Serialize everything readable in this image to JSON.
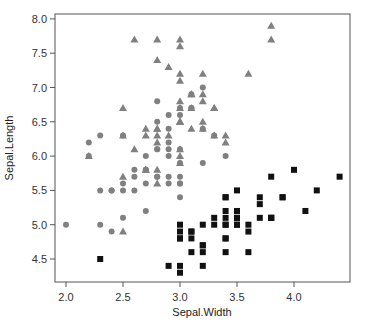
{
  "chart_data": {
    "type": "scatter",
    "title": "",
    "xlabel": "Sepal.Width",
    "ylabel": "Sepal.Length",
    "xlim": [
      1.9,
      4.5
    ],
    "ylim": [
      4.2,
      8.05
    ],
    "x_ticks": [
      "2.0",
      "2.5",
      "3.0",
      "3.5",
      "4.0"
    ],
    "y_ticks": [
      "4.5",
      "5.0",
      "5.5",
      "6.0",
      "6.5",
      "7.0",
      "7.5",
      "8.0"
    ],
    "grid": false,
    "legend": "none",
    "series": [
      {
        "name": "setosa",
        "marker": "square",
        "color": "#111111",
        "points": [
          [
            3.5,
            5.1
          ],
          [
            3.0,
            4.9
          ],
          [
            3.2,
            4.7
          ],
          [
            3.1,
            4.6
          ],
          [
            3.6,
            5.0
          ],
          [
            3.9,
            5.4
          ],
          [
            3.4,
            4.6
          ],
          [
            3.4,
            5.0
          ],
          [
            2.9,
            4.4
          ],
          [
            3.1,
            4.9
          ],
          [
            3.7,
            5.4
          ],
          [
            3.4,
            4.8
          ],
          [
            3.0,
            4.8
          ],
          [
            3.0,
            4.3
          ],
          [
            4.0,
            5.8
          ],
          [
            4.4,
            5.7
          ],
          [
            3.9,
            5.4
          ],
          [
            3.5,
            5.1
          ],
          [
            3.8,
            5.7
          ],
          [
            3.8,
            5.1
          ],
          [
            3.4,
            5.4
          ],
          [
            3.7,
            5.1
          ],
          [
            3.6,
            4.6
          ],
          [
            3.3,
            5.1
          ],
          [
            3.4,
            4.8
          ],
          [
            3.0,
            5.0
          ],
          [
            3.4,
            5.0
          ],
          [
            3.5,
            5.2
          ],
          [
            3.4,
            5.2
          ],
          [
            3.2,
            4.7
          ],
          [
            3.1,
            4.8
          ],
          [
            3.4,
            5.4
          ],
          [
            4.1,
            5.2
          ],
          [
            4.2,
            5.5
          ],
          [
            3.1,
            4.9
          ],
          [
            3.2,
            5.0
          ],
          [
            3.5,
            5.5
          ],
          [
            3.6,
            4.9
          ],
          [
            3.0,
            4.4
          ],
          [
            3.4,
            5.1
          ],
          [
            3.5,
            5.0
          ],
          [
            2.3,
            4.5
          ],
          [
            3.2,
            4.4
          ],
          [
            3.5,
            5.0
          ],
          [
            3.8,
            5.1
          ],
          [
            3.0,
            4.8
          ],
          [
            3.8,
            5.1
          ],
          [
            3.2,
            4.6
          ],
          [
            3.7,
            5.3
          ],
          [
            3.3,
            5.0
          ]
        ]
      },
      {
        "name": "versicolor",
        "marker": "circle",
        "color": "#808080",
        "points": [
          [
            3.2,
            7.0
          ],
          [
            3.2,
            6.4
          ],
          [
            3.1,
            6.9
          ],
          [
            2.3,
            5.5
          ],
          [
            2.8,
            6.5
          ],
          [
            2.8,
            5.7
          ],
          [
            3.3,
            6.3
          ],
          [
            2.4,
            4.9
          ],
          [
            2.9,
            6.6
          ],
          [
            2.7,
            5.2
          ],
          [
            2.0,
            5.0
          ],
          [
            3.0,
            5.9
          ],
          [
            2.2,
            6.0
          ],
          [
            2.9,
            6.1
          ],
          [
            2.9,
            5.6
          ],
          [
            3.1,
            6.7
          ],
          [
            3.0,
            5.6
          ],
          [
            2.7,
            5.8
          ],
          [
            2.2,
            6.2
          ],
          [
            2.5,
            5.6
          ],
          [
            3.2,
            5.9
          ],
          [
            2.8,
            6.1
          ],
          [
            2.5,
            6.3
          ],
          [
            2.8,
            6.1
          ],
          [
            2.9,
            6.4
          ],
          [
            3.0,
            6.6
          ],
          [
            2.8,
            6.8
          ],
          [
            3.0,
            6.7
          ],
          [
            2.9,
            6.0
          ],
          [
            2.6,
            5.7
          ],
          [
            2.4,
            5.5
          ],
          [
            2.4,
            5.5
          ],
          [
            2.7,
            5.8
          ],
          [
            2.7,
            6.0
          ],
          [
            3.0,
            5.4
          ],
          [
            3.4,
            6.0
          ],
          [
            3.1,
            6.7
          ],
          [
            2.3,
            6.3
          ],
          [
            3.0,
            5.6
          ],
          [
            2.5,
            5.5
          ],
          [
            2.6,
            5.5
          ],
          [
            3.0,
            6.1
          ],
          [
            2.6,
            5.8
          ],
          [
            2.3,
            5.0
          ],
          [
            2.7,
            5.6
          ],
          [
            3.0,
            5.7
          ],
          [
            2.9,
            5.7
          ],
          [
            2.9,
            6.2
          ],
          [
            2.5,
            5.1
          ],
          [
            2.8,
            5.7
          ]
        ]
      },
      {
        "name": "virginica",
        "marker": "triangle",
        "color": "#808080",
        "points": [
          [
            3.3,
            6.3
          ],
          [
            2.7,
            5.8
          ],
          [
            3.0,
            7.1
          ],
          [
            2.9,
            6.3
          ],
          [
            3.0,
            6.5
          ],
          [
            3.0,
            7.6
          ],
          [
            2.5,
            4.9
          ],
          [
            2.9,
            7.3
          ],
          [
            2.5,
            6.7
          ],
          [
            3.6,
            7.2
          ],
          [
            3.2,
            6.5
          ],
          [
            2.7,
            6.4
          ],
          [
            3.0,
            6.8
          ],
          [
            2.5,
            5.7
          ],
          [
            2.8,
            5.8
          ],
          [
            3.2,
            6.4
          ],
          [
            3.0,
            6.5
          ],
          [
            3.8,
            7.7
          ],
          [
            2.6,
            7.7
          ],
          [
            2.2,
            6.0
          ],
          [
            3.2,
            6.9
          ],
          [
            2.8,
            5.6
          ],
          [
            2.8,
            7.7
          ],
          [
            2.7,
            6.3
          ],
          [
            3.3,
            6.7
          ],
          [
            3.2,
            7.2
          ],
          [
            2.8,
            6.2
          ],
          [
            3.0,
            6.1
          ],
          [
            2.8,
            6.4
          ],
          [
            3.0,
            7.2
          ],
          [
            2.8,
            7.4
          ],
          [
            3.8,
            7.9
          ],
          [
            2.8,
            6.4
          ],
          [
            2.8,
            6.3
          ],
          [
            2.6,
            6.1
          ],
          [
            3.0,
            7.7
          ],
          [
            3.4,
            6.3
          ],
          [
            3.1,
            6.4
          ],
          [
            3.0,
            6.0
          ],
          [
            3.1,
            6.9
          ],
          [
            3.1,
            6.7
          ],
          [
            3.1,
            6.9
          ],
          [
            2.7,
            5.8
          ],
          [
            3.2,
            6.8
          ],
          [
            3.3,
            6.7
          ],
          [
            3.0,
            6.7
          ],
          [
            2.5,
            6.3
          ],
          [
            3.0,
            6.5
          ],
          [
            3.4,
            6.2
          ],
          [
            3.0,
            5.9
          ]
        ]
      }
    ]
  },
  "layout": {
    "plot_left": 55,
    "plot_right": 350,
    "plot_top": 14,
    "plot_bottom": 282,
    "x0_value": 2.0,
    "x0_px": 66,
    "px_per_x": 114,
    "y0_value": 4.5,
    "y0_px": 259,
    "px_per_y": 68.6
  }
}
